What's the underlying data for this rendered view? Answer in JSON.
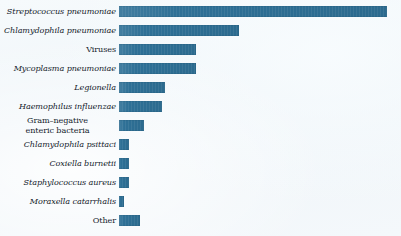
{
  "figure": {
    "caption_fragment": "",
    "background_color": "#f2f7fa",
    "bar_color": "#2e7096"
  },
  "chart_data": {
    "type": "bar",
    "orientation": "horizontal",
    "title": "",
    "subtitle": "",
    "xlabel": "",
    "ylabel": "",
    "grid": false,
    "legend": "none",
    "axis_visible": false,
    "value_labels_shown": false,
    "xlim": [
      0,
      100
    ],
    "units": "relative frequency (percent of plot width)",
    "categories": [
      "Streptococcus pneumoniae",
      "Chlamydophila pneumoniae",
      "Viruses",
      "Mycoplasma pneumoniae",
      "Legionella",
      "Haemophilus influenzae",
      "Gram–negative enteric bacteria",
      "Chlamydophila psittaci",
      "Coxiella burnetii",
      "Staphylococcus aureus",
      "Moraxella catarrhalis",
      "Other"
    ],
    "values": [
      96,
      43,
      27.5,
      27.5,
      16.5,
      15.5,
      9,
      3.5,
      3.5,
      3.5,
      1.8,
      7.5
    ],
    "series": [
      {
        "name": "Frequency",
        "values": [
          96,
          43,
          27.5,
          27.5,
          16.5,
          15.5,
          9,
          3.5,
          3.5,
          3.5,
          1.8,
          7.5
        ]
      }
    ],
    "bars": [
      {
        "label": "Streptococcus pneumoniae",
        "value": 96,
        "width_px": 268,
        "italic": true,
        "two_line": false
      },
      {
        "label": "Chlamydophila pneumoniae",
        "value": 43,
        "width_px": 120,
        "italic": true,
        "two_line": false
      },
      {
        "label": "Viruses",
        "value": 27.5,
        "width_px": 77,
        "italic": false,
        "two_line": false
      },
      {
        "label": "Mycoplasma pneumoniae",
        "value": 27.5,
        "width_px": 77,
        "italic": true,
        "two_line": false
      },
      {
        "label": "Legionella",
        "value": 16.5,
        "width_px": 46,
        "italic": true,
        "two_line": false
      },
      {
        "label": "Haemophilus influenzae",
        "value": 15.5,
        "width_px": 43,
        "italic": true,
        "two_line": false
      },
      {
        "label": "Gram–negative\nenteric bacteria",
        "value": 9,
        "width_px": 25,
        "italic": false,
        "two_line": true
      },
      {
        "label": "Chlamydophila psittaci",
        "value": 3.5,
        "width_px": 10,
        "italic": true,
        "two_line": false
      },
      {
        "label": "Coxiella burnetii",
        "value": 3.5,
        "width_px": 10,
        "italic": true,
        "two_line": false
      },
      {
        "label": "Staphylococcus aureus",
        "value": 3.5,
        "width_px": 10,
        "italic": true,
        "two_line": false
      },
      {
        "label": "Moraxella catarrhalis",
        "value": 1.8,
        "width_px": 5,
        "italic": true,
        "two_line": false
      },
      {
        "label": "Other",
        "value": 7.5,
        "width_px": 21,
        "italic": false,
        "two_line": false
      }
    ]
  }
}
